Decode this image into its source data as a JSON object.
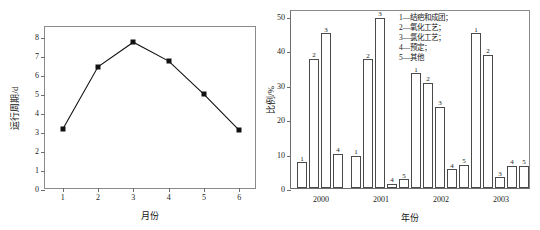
{
  "chart_data": [
    {
      "type": "line",
      "title": "",
      "xlabel": "月份",
      "ylabel": "运行周期/d",
      "x": [
        1,
        2,
        3,
        4,
        5,
        6
      ],
      "values": [
        3.2,
        6.5,
        7.8,
        6.8,
        5.05,
        3.15
      ],
      "xticks": [
        "1",
        "2",
        "3",
        "4",
        "5",
        "6"
      ],
      "yticks": [
        "0",
        "1",
        "2",
        "3",
        "4",
        "5",
        "6",
        "7",
        "8"
      ],
      "xlim": [
        0.5,
        6.5
      ],
      "ylim": [
        0,
        8.6
      ],
      "grid": false,
      "marker": "filled-square",
      "legend": "none",
      "color": "#111111"
    },
    {
      "type": "bar",
      "title": "",
      "xlabel": "年份",
      "ylabel": "比例/%",
      "categories": [
        "2000",
        "2001",
        "2002",
        "2003"
      ],
      "yticks": [
        "0",
        "10",
        "20",
        "30",
        "40",
        "50"
      ],
      "ylim": [
        0,
        52
      ],
      "grid": false,
      "legend_position": "top-right",
      "legend": [
        "1—结疤和成团；",
        "2—氧化工艺；",
        "3—氯化工艺；",
        "4—预定；",
        "5—其他"
      ],
      "series": [
        {
          "name": "1",
          "values": [
            7.5,
            9.3,
            33.4,
            45.0
          ]
        },
        {
          "name": "2",
          "values": [
            37.5,
            37.4,
            30.6,
            38.7
          ]
        },
        {
          "name": "3",
          "values": [
            45.0,
            49.5,
            23.6,
            3.1
          ]
        },
        {
          "name": "4",
          "values": [
            10.0,
            1.2,
            5.5,
            6.4
          ]
        },
        {
          "name": "5",
          "values": [
            0,
            2.5,
            6.8,
            6.4
          ]
        }
      ],
      "bar_labels": {
        "2000": [
          "1",
          "2",
          "3",
          "4"
        ],
        "2001": [
          "1",
          "2",
          "3",
          "4",
          "5"
        ],
        "2002": [
          "1",
          "2",
          "3",
          "4",
          "5"
        ],
        "2003": [
          "1",
          "2",
          "3",
          "4",
          "5"
        ]
      },
      "bar_facecolor": "#ffffff",
      "bar_edgecolor": "#4a4a4a"
    }
  ]
}
